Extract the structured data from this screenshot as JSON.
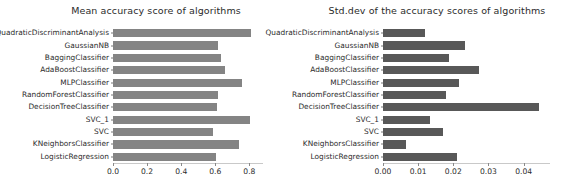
{
  "figure": {
    "width": 568,
    "height": 194,
    "background": "#ffffff"
  },
  "chart_data": [
    {
      "type": "bar",
      "orientation": "horizontal",
      "title": "Mean accuracy score of algorithms",
      "xlabel": "",
      "ylabel": "",
      "xlim": [
        0.0,
        0.88
      ],
      "xticks": [
        0.0,
        0.2,
        0.4,
        0.6,
        0.8
      ],
      "xtick_labels": [
        "0.0",
        "0.2",
        "0.4",
        "0.6",
        "0.8"
      ],
      "grid": false,
      "legend": null,
      "bar_color": "#848484",
      "categories": [
        "QuadraticDiscriminantAnalysis",
        "GaussianNB",
        "BaggingClassifier",
        "AdaBoostClassifier",
        "MLPClassifier",
        "RandomForestClassifier",
        "DecisionTreeClassifier",
        "SVC_1",
        "SVC",
        "KNeighborsClassifier",
        "LogisticRegression"
      ],
      "values": [
        0.812,
        0.618,
        0.632,
        0.655,
        0.757,
        0.618,
        0.61,
        0.806,
        0.588,
        0.741,
        0.604
      ]
    },
    {
      "type": "bar",
      "orientation": "horizontal",
      "title": "Std.dev of the accuracy scores of algorithms",
      "xlabel": "",
      "ylabel": "",
      "xlim": [
        0.0,
        0.0475
      ],
      "xticks": [
        0.0,
        0.01,
        0.02,
        0.03,
        0.04
      ],
      "xtick_labels": [
        "0.00",
        "0.01",
        "0.02",
        "0.03",
        "0.04"
      ],
      "grid": false,
      "legend": null,
      "bar_color": "#585858",
      "categories": [
        "QuadraticDiscriminantAnalysis",
        "GaussianNB",
        "BaggingClassifier",
        "AdaBoostClassifier",
        "MLPClassifier",
        "RandomForestClassifier",
        "DecisionTreeClassifier",
        "SVC_1",
        "SVC",
        "KNeighborsClassifier",
        "LogisticRegression"
      ],
      "values": [
        0.0119,
        0.0234,
        0.0189,
        0.0272,
        0.0216,
        0.0178,
        0.0445,
        0.0135,
        0.0172,
        0.0066,
        0.021
      ]
    }
  ]
}
